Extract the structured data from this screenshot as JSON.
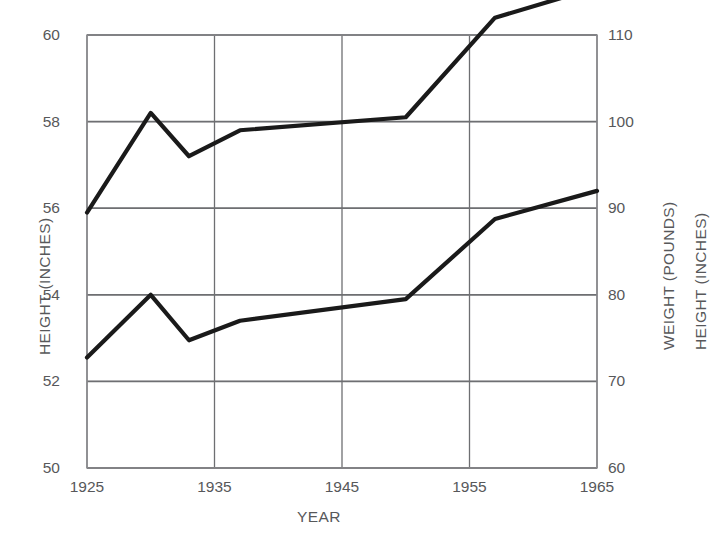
{
  "chart_data": {
    "type": "line",
    "title": "",
    "xlabel": "YEAR",
    "ylabel": "HEIGHT (INCHES)",
    "y2label": "WEIGHT (POUNDS)",
    "y3label": "HEIGHT (INCHES)",
    "xlim": [
      1925,
      1965
    ],
    "xticks": [
      1925,
      1935,
      1945,
      1955,
      1965
    ],
    "xticklabels": [
      "1925",
      "1935",
      "1945",
      "1955",
      "1965"
    ],
    "ylim": [
      50,
      60
    ],
    "yticks": [
      50,
      52,
      54,
      56,
      58,
      60
    ],
    "yticklabels": [
      "50",
      "52",
      "54",
      "56",
      "58",
      "60"
    ],
    "y2lim": [
      60,
      110
    ],
    "y2ticks": [
      60,
      70,
      80,
      90,
      100,
      110
    ],
    "y2ticklabels": [
      "60",
      "70",
      "80",
      "90",
      "100",
      "110"
    ],
    "grid": true,
    "grid_major_color": "#6e6f72",
    "grid_minor_color": "#c9cacc",
    "line_color": "#1a1a1a",
    "legend": "none",
    "series": [
      {
        "name": "WEIGHT (POUNDS)",
        "axis": "right",
        "x": [
          1925,
          1930,
          1933,
          1937,
          1950,
          1957,
          1965
        ],
        "values": [
          89.5,
          101.0,
          96.0,
          99.0,
          100.5,
          112.0,
          115.5
        ]
      },
      {
        "name": "HEIGHT (INCHES)",
        "axis": "left",
        "x": [
          1925,
          1930,
          1933,
          1937,
          1950,
          1957,
          1965
        ],
        "values": [
          52.55,
          54.0,
          52.95,
          53.4,
          53.9,
          55.75,
          56.4
        ]
      }
    ]
  },
  "geometry": {
    "plot_left": 87,
    "plot_right": 597,
    "plot_top": 35,
    "plot_bottom": 468
  }
}
